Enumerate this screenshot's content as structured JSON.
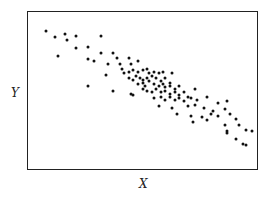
{
  "chart_data": {
    "type": "scatter",
    "title": "",
    "xlabel": "X",
    "ylabel": "Y",
    "xlim": [
      0,
      100
    ],
    "ylim": [
      0,
      100
    ],
    "grid": false,
    "legend": null,
    "ticks": "none",
    "points": [
      [
        8,
        88
      ],
      [
        16,
        86
      ],
      [
        12,
        84
      ],
      [
        21,
        85
      ],
      [
        17,
        82
      ],
      [
        32,
        85
      ],
      [
        21,
        77
      ],
      [
        26,
        78
      ],
      [
        13,
        72
      ],
      [
        26,
        70
      ],
      [
        32,
        74
      ],
      [
        29,
        69
      ],
      [
        37,
        74
      ],
      [
        35,
        67
      ],
      [
        26,
        53
      ],
      [
        34,
        60
      ],
      [
        39,
        71
      ],
      [
        40,
        67
      ],
      [
        44,
        71
      ],
      [
        48,
        69
      ],
      [
        45,
        67
      ],
      [
        41,
        64
      ],
      [
        42,
        61
      ],
      [
        44,
        62
      ],
      [
        46,
        63
      ],
      [
        48,
        62
      ],
      [
        50,
        63
      ],
      [
        52,
        64
      ],
      [
        53,
        61
      ],
      [
        55,
        62
      ],
      [
        57,
        61
      ],
      [
        59,
        62
      ],
      [
        63,
        61
      ],
      [
        44,
        58
      ],
      [
        46,
        57
      ],
      [
        47,
        59
      ],
      [
        49,
        58
      ],
      [
        50,
        57
      ],
      [
        52,
        58
      ],
      [
        54,
        59
      ],
      [
        56,
        58
      ],
      [
        58,
        56
      ],
      [
        60,
        58
      ],
      [
        62,
        55
      ],
      [
        48,
        54
      ],
      [
        50,
        55
      ],
      [
        51,
        53
      ],
      [
        53,
        56
      ],
      [
        55,
        54
      ],
      [
        57,
        53
      ],
      [
        59,
        54
      ],
      [
        60,
        52
      ],
      [
        62,
        53
      ],
      [
        64,
        51
      ],
      [
        66,
        53
      ],
      [
        37,
        50
      ],
      [
        45,
        48
      ],
      [
        46,
        47
      ],
      [
        50,
        51
      ],
      [
        52,
        50
      ],
      [
        54,
        49
      ],
      [
        56,
        51
      ],
      [
        58,
        49
      ],
      [
        60,
        50
      ],
      [
        62,
        48
      ],
      [
        64,
        49
      ],
      [
        66,
        47
      ],
      [
        68,
        49
      ],
      [
        70,
        46
      ],
      [
        73,
        51
      ],
      [
        55,
        45
      ],
      [
        58,
        46
      ],
      [
        60,
        44
      ],
      [
        62,
        46
      ],
      [
        64,
        44
      ],
      [
        66,
        45
      ],
      [
        68,
        43
      ],
      [
        71,
        45
      ],
      [
        74,
        44
      ],
      [
        78,
        46
      ],
      [
        83,
        42
      ],
      [
        87,
        43
      ],
      [
        57,
        40
      ],
      [
        63,
        39
      ],
      [
        70,
        40
      ],
      [
        73,
        41
      ],
      [
        77,
        39
      ],
      [
        81,
        37
      ],
      [
        86,
        38
      ],
      [
        65,
        35
      ],
      [
        71,
        34
      ],
      [
        76,
        33
      ],
      [
        80,
        35
      ],
      [
        83,
        34
      ],
      [
        88,
        35
      ],
      [
        91,
        32
      ],
      [
        72,
        30
      ],
      [
        78,
        31
      ],
      [
        86,
        28
      ],
      [
        92,
        28
      ],
      [
        95,
        25
      ],
      [
        87,
        24
      ],
      [
        87,
        23
      ],
      [
        91,
        19
      ],
      [
        98,
        24
      ],
      [
        94,
        16
      ],
      [
        95,
        15
      ]
    ]
  }
}
